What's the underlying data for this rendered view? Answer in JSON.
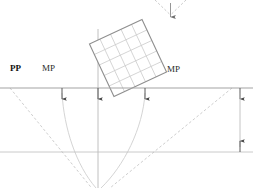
{
  "figure": {
    "kind": "perspective-construction-drawing",
    "background_color": "#ffffff",
    "line_color": "#a9a9a9",
    "dashed_color": "#bcbcbc",
    "solid_dark_color": "#8c8c8c",
    "text_color": "#2b2b2b",
    "width": 253,
    "height": 188
  },
  "labels": {
    "picture_plane": "PP",
    "measuring_point_left": "MP",
    "measuring_point_right": "MP"
  },
  "label_positions": {
    "picture_plane": {
      "x": 10,
      "y": 66
    },
    "measuring_point_left": {
      "x": 42,
      "y": 66
    },
    "measuring_point_right": {
      "x": 167,
      "y": 67
    }
  },
  "geometry": {
    "picture_plane_line": {
      "x1": 0,
      "y1": 88,
      "x2": 253,
      "y2": 88
    },
    "ground_line": {
      "x1": 0,
      "y1": 152,
      "x2": 253,
      "y2": 152
    },
    "center_vertical_line": {
      "x": 98,
      "y1": 29,
      "y2": 188
    },
    "station_point": {
      "x": 98,
      "y": 195
    },
    "top_arrow_apex": {
      "x": 170,
      "y": 19
    },
    "dimension_line": {
      "x": 240,
      "y_top": 88,
      "y_bottom": 152
    },
    "ticks": [
      {
        "name": "tick-mp-left",
        "x": 62,
        "y": 88,
        "length": 11
      },
      {
        "name": "tick-center",
        "x": 98,
        "y": 88,
        "length": 11
      },
      {
        "name": "tick-mp-right",
        "x": 145,
        "y": 88,
        "length": 11
      },
      {
        "name": "tick-right-edge",
        "x": 240,
        "y": 88,
        "length": 11
      }
    ],
    "grid_square": {
      "center_x": 128,
      "center_y": 58,
      "size": 58,
      "rotation_deg": -25,
      "divisions": 5
    },
    "dashed_diagonals": [
      {
        "name": "diagonal-left",
        "x1": 10,
        "y1": 88,
        "x2": 98,
        "y2": 196
      },
      {
        "name": "diagonal-right",
        "x1": 232,
        "y1": 88,
        "x2": 98,
        "y2": 196
      }
    ],
    "curved_lines": [
      {
        "name": "curve-left",
        "x1": 62,
        "y1": 92,
        "cx": 68,
        "cy": 150,
        "x2": 96,
        "y2": 188
      },
      {
        "name": "curve-right",
        "x1": 145,
        "y1": 92,
        "cx": 140,
        "cy": 150,
        "x2": 101,
        "y2": 188
      }
    ],
    "top_converging_dashes": [
      {
        "name": "top-dash-left",
        "x1": 155,
        "y1": 0,
        "x2": 170,
        "y2": 17
      },
      {
        "name": "top-dash-right",
        "x1": 186,
        "y1": 0,
        "x2": 170,
        "y2": 17
      }
    ]
  }
}
